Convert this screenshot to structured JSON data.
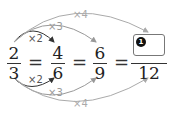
{
  "equation": {
    "fractions": [
      {
        "numerator": "2",
        "denominator": "3"
      },
      {
        "numerator": "4",
        "denominator": "6"
      },
      {
        "numerator": "6",
        "denominator": "9"
      },
      {
        "numerator_blank_badge": "1",
        "denominator": "12"
      }
    ],
    "equals": "="
  },
  "arrows": {
    "top": [
      {
        "label": "×2",
        "color": "#333333"
      },
      {
        "label": "×3",
        "color": "#999999"
      },
      {
        "label": "×4",
        "color": "#aaaaaa"
      }
    ],
    "bottom": [
      {
        "label": "×2",
        "color": "#333333"
      },
      {
        "label": "×3",
        "color": "#999999"
      },
      {
        "label": "×4",
        "color": "#aaaaaa"
      }
    ]
  }
}
